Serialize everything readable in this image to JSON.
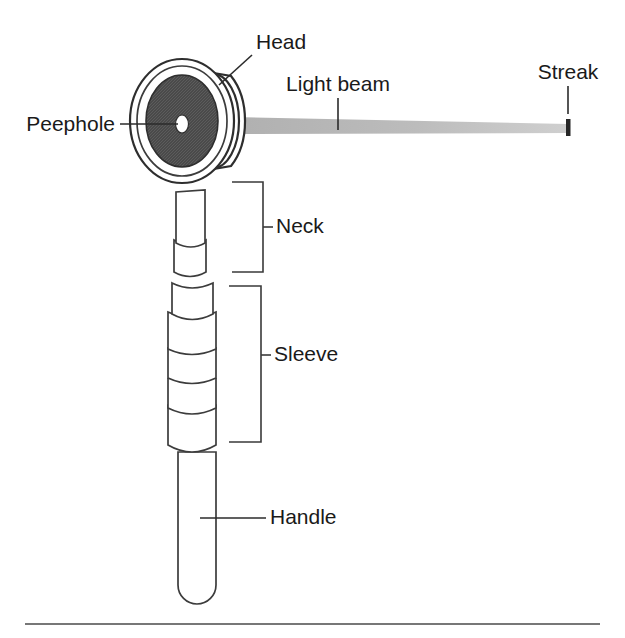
{
  "figure": {
    "background_color": "#ffffff",
    "stroke_color": "#3c3c3c",
    "ink_color": "#1a1a1a"
  },
  "labels": {
    "head": "Head",
    "peephole": "Peephole",
    "light_beam": "Light beam",
    "streak": "Streak",
    "neck": "Neck",
    "sleeve": "Sleeve",
    "handle": "Handle"
  },
  "parts": {
    "head": {
      "name": "Head",
      "description": "Circular rimmed head viewed at an angle, dark hatched face",
      "face_color": "#4d4d4d",
      "rim_color": "#ffffff",
      "outline_color": "#2e2e2e"
    },
    "peephole": {
      "name": "Peephole",
      "description": "Small white aperture at the centre of the head face",
      "color": "#ffffff"
    },
    "light_beam": {
      "name": "Light beam",
      "description": "Grey tapering wedge of light projected to the right",
      "color": "#b8b8b8"
    },
    "streak": {
      "name": "Streak",
      "description": "Short vertical dark mark at the far end of the beam",
      "color": "#262626"
    },
    "neck": {
      "name": "Neck",
      "description": "Narrow tube below the head with one knurled band",
      "color": "#ffffff"
    },
    "sleeve": {
      "name": "Sleeve",
      "description": "Wider stepped barrel with two knurled grip bands",
      "color": "#ffffff"
    },
    "handle": {
      "name": "Handle",
      "description": "Long cylindrical grip with a rounded base",
      "color": "#ffffff"
    }
  },
  "knurl": {
    "pattern": "cross-hatch diamond",
    "line_color": "#5a5a5a",
    "fill_color": "#d9d9d9"
  }
}
